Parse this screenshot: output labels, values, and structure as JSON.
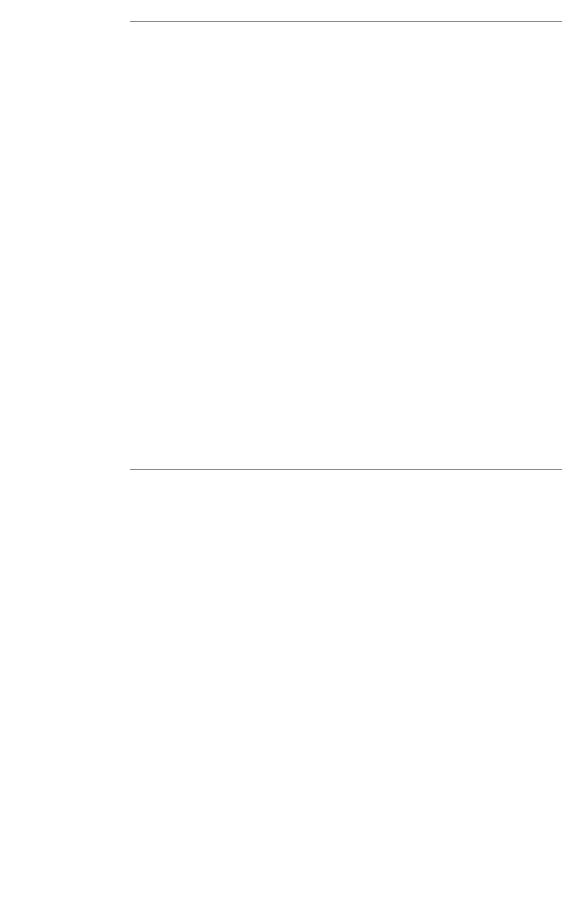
{
  "chart_data": [
    {
      "type": "bar",
      "orientation": "horizontal",
      "title": "",
      "xlabel": "",
      "ylabel": "",
      "xlim": [
        0,
        15
      ],
      "xticks": [
        0,
        5,
        10,
        15
      ],
      "grid": false,
      "legend": "",
      "bar_color": "#1b1b1b",
      "categories": [
        "Japan, Miyagi",
        "nd, Cracow City",
        "Hong Kong",
        "cratic Republic",
        ", Colombia, Cali",
        "ands, Eindhoven",
        "Italy, Varese",
        "Sweden",
        "zerland, Geneva",
        "azil, Sao Paulo",
        "Costa Rica",
        "awaii: Hawaiian",
        "ngapore: Indian",
        "FRG, Saarland",
        "nnecticut: White",
        "lavia, Slovenia",
        "srael: All Jews",
        "gapore: Chinese",
        "rance, Bas-Rhin",
        "zabolcs-Szatmar",
        "Zealand: Maori",
        "Spain, Navarra",
        "Canada",
        "Denmark",
        "US, Puerto Rico",
        "China, Shanghai",
        "New South Wales",
        "es: Other White",
        "UK, Scotland",
        "Angeles: Black",
        "eland, Southern",
        "England & Wales",
        "geles: Japanese",
        "nnecticut: Black",
        "uwait: Kuwaitis",
        "Norway",
        "India, Bombay",
        "ngeles: Chinese",
        "lippines, Rizal",
        "a, County Cluj"
      ],
      "values": [
        5.9,
        3.9,
        3.6,
        3.5,
        3.0,
        3.0,
        2.9,
        2.8,
        2.8,
        2.7,
        2.5,
        2.5,
        2.4,
        2.4,
        2.3,
        2.3,
        2.1,
        2.1,
        2.1,
        2.1,
        2.1,
        2.0,
        1.9,
        1.9,
        1.7,
        1.6,
        1.6,
        1.6,
        1.5,
        1.3,
        1.3,
        1.2,
        1.1,
        1.1,
        1.1,
        1.1,
        0.9,
        0.8,
        0.7,
        0.7
      ],
      "stars": [
        false,
        false,
        false,
        false,
        false,
        false,
        false,
        false,
        false,
        false,
        false,
        true,
        true,
        false,
        false,
        false,
        false,
        false,
        false,
        false,
        true,
        false,
        false,
        false,
        false,
        false,
        false,
        false,
        false,
        false,
        false,
        false,
        true,
        true,
        true,
        false,
        false,
        true,
        false,
        false
      ],
      "extra_categories": [
        "American Indian",
        "India, Poona"
      ],
      "extra_values": [
        10.8,
        0.4
      ],
      "extra_stars": [
        false,
        false
      ]
    },
    {
      "type": "bar",
      "orientation": "horizontal",
      "title": "",
      "xlabel": "",
      "ylabel": "",
      "xlim": [
        0,
        15
      ],
      "xticks": [
        0,
        5,
        10,
        15
      ],
      "grid": false,
      "legend": "",
      "bar_color": "#434343",
      "categories": [
        ", Colombia, Cali",
        "nd, Cracow City",
        "ocratic Republic",
        "Szabolcs-Szatmar",
        "Costa Rica",
        "FRG, Saarland",
        "Japan, Miyagi",
        "Sweden",
        "lavia, Slovenia",
        "srael: All Jews",
        "Spain, Navarra",
        "azil, Sao Paulo",
        "ands, Eindhoven",
        "Italy, Varese",
        "zerland, Geneva",
        "Denmark",
        "rance, Bas-Rhin",
        "Hawaii: Hawaiian",
        "US, Puerto Rico",
        "Hong Kong",
        "w Zealand: Maori",
        "Canada",
        "China, Shanghai",
        "onnecticut: White",
        "ingapore: Indian",
        "New South Wales",
        "ngapore: Chinese",
        "les: Other White",
        "UK, Scotland",
        "reland, Southern",
        "Norway",
        "s Angeles: Black",
        "Angeles: Chinese",
        "England & Wales",
        "nnecticut: Black",
        "ngeles: Japanese",
        "ilippines, Rizal",
        "nia, County Cluj",
        "India, Bombay",
        "Kuwait: Kuwaitis"
      ],
      "values": [
        9.4,
        8.0,
        7.2,
        6.3,
        5.7,
        5.4,
        5.3,
        4.9,
        4.5,
        4.4,
        4.4,
        4.3,
        4.2,
        3.7,
        3.2,
        3.1,
        3.0,
        2.8,
        2.7,
        2.5,
        2.4,
        2.3,
        2.3,
        2.0,
        2.0,
        1.9,
        1.6,
        1.6,
        1.6,
        1.5,
        1.5,
        1.3,
        1.3,
        1.3,
        1.2,
        1.1,
        1.1,
        1.1,
        1.0,
        0.5
      ],
      "stars": [
        false,
        false,
        false,
        false,
        false,
        false,
        false,
        false,
        false,
        false,
        false,
        false,
        false,
        false,
        false,
        false,
        false,
        true,
        false,
        false,
        true,
        false,
        false,
        false,
        true,
        false,
        false,
        false,
        false,
        false,
        false,
        false,
        true,
        false,
        true,
        true,
        false,
        false,
        false,
        true
      ],
      "extra_categories": [
        "American Indian",
        "India, Poona"
      ],
      "extra_values": [
        13.2,
        0.7
      ],
      "extra_stars": [
        false,
        false
      ]
    }
  ]
}
